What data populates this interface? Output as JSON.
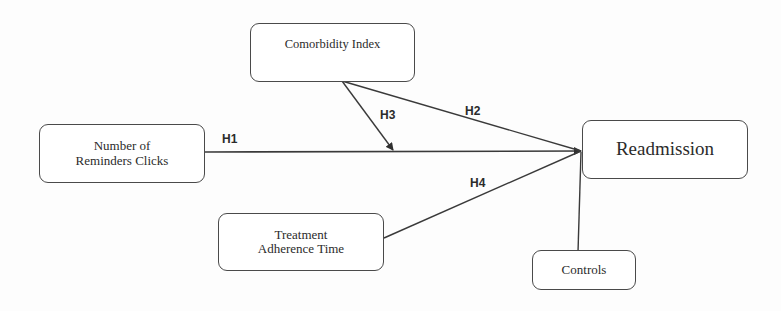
{
  "diagram": {
    "type": "conceptual-model",
    "nodes": {
      "comorbidity": {
        "label": "Comorbidity Index"
      },
      "reminders": {
        "line1": "Number of",
        "line2": "Reminders Clicks"
      },
      "adherence": {
        "line1": "Treatment",
        "line2": "Adherence Time"
      },
      "readmission": {
        "label": "Readmission"
      },
      "controls": {
        "label": "Controls"
      }
    },
    "edges": [
      {
        "id": "H1",
        "from": "Number of Reminders Clicks",
        "to": "Readmission",
        "label": "H1"
      },
      {
        "id": "H2",
        "from": "Comorbidity Index",
        "to": "Readmission",
        "label": "H2"
      },
      {
        "id": "H3",
        "from": "Comorbidity Index",
        "to": "H1 path (moderation)",
        "label": "H3"
      },
      {
        "id": "H4",
        "from": "Treatment Adherence Time",
        "to": "Readmission",
        "label": "H4"
      },
      {
        "id": "controls",
        "from": "Controls",
        "to": "Readmission",
        "label": ""
      }
    ],
    "colors": {
      "line": "#3a3a3a",
      "border": "#4a4a4a",
      "text": "#2b2b2b"
    }
  }
}
